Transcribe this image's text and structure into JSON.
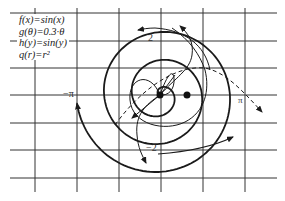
{
  "legend": {
    "items": [
      {
        "label": "f(x)=sin(x)"
      },
      {
        "label": "g(θ)=0.3·θ"
      },
      {
        "label": "h(y)=sin(y)"
      },
      {
        "label": "q(r)=r²"
      }
    ]
  },
  "axis_labels": {
    "neg_pi": "−π",
    "pi": "π",
    "two": "2",
    "neg_two_left": "−2",
    "neg_two_right": "−2"
  },
  "grid": {
    "vertical_x": [
      35,
      77,
      119,
      161,
      203,
      245
    ],
    "horizontal_y": [
      13,
      41,
      68,
      95,
      123,
      150,
      178
    ],
    "x_extent": [
      10,
      277
    ],
    "y_extent": [
      8,
      192
    ]
  },
  "points": [
    {
      "name": "origin",
      "x": 160,
      "y": 95
    },
    {
      "name": "point-b",
      "x": 187,
      "y": 95
    }
  ],
  "colors": {
    "line": "#1a1a1a",
    "grid": "#333333",
    "background": "#ffffff"
  },
  "chart_data": {
    "type": "line",
    "title": "",
    "series": [
      {
        "name": "g(θ)=0.3·θ (spiral)",
        "style": "thick solid",
        "theta_range": [
          0,
          18.8
        ]
      },
      {
        "name": "f(x)=sin(x) (mapped curve)",
        "style": "thin solid with arrows"
      },
      {
        "name": "h(y)=sin(y) (mapped curve)",
        "style": "thin solid with arrows"
      },
      {
        "name": "q(r)=r² (dashed)",
        "style": "dashed with arrow"
      }
    ],
    "annotations": [
      "−π",
      "π",
      "2",
      "−2",
      "−2"
    ],
    "grid": true
  }
}
